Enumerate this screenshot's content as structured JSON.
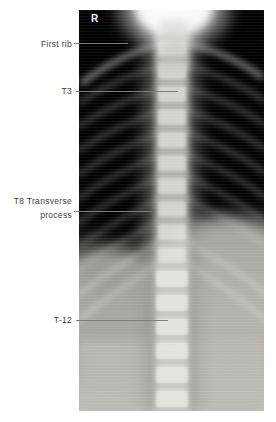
{
  "figure": {
    "orientation_marker": "R",
    "annotations": [
      {
        "id": "first-rib",
        "label": "First rib"
      },
      {
        "id": "t3",
        "label": "T3"
      },
      {
        "id": "t8-transverse-process",
        "label": "T8 Transverse\nprocess"
      },
      {
        "id": "t12",
        "label": "T-12"
      }
    ],
    "colors": {
      "page_background": "#ffffff",
      "label_text": "#3f3f3f",
      "leader_line": "#7d7d7d",
      "marker_text": "#f2f2f2",
      "xray_dark": "#101010",
      "xray_light": "#c0beb8"
    }
  }
}
